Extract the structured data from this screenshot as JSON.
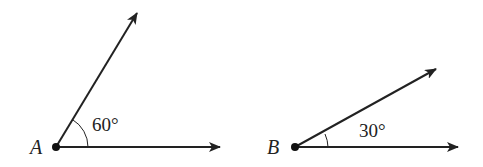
{
  "diagram": {
    "angles": [
      {
        "vertex_label": "A",
        "measure_label": "60°",
        "measure_deg": 60,
        "vertex": [
          56,
          147
        ],
        "ray_horizontal_end": [
          220,
          147
        ],
        "ray_upper_end": [
          137,
          13
        ],
        "arc_radius": 32
      },
      {
        "vertex_label": "B",
        "measure_label": "30°",
        "measure_deg": 30,
        "vertex": [
          295,
          147
        ],
        "ray_horizontal_end": [
          458,
          147
        ],
        "ray_upper_end": [
          436,
          69
        ],
        "arc_radius": 28
      }
    ],
    "colors": {
      "stroke": "#222222",
      "background": "#ffffff"
    }
  }
}
